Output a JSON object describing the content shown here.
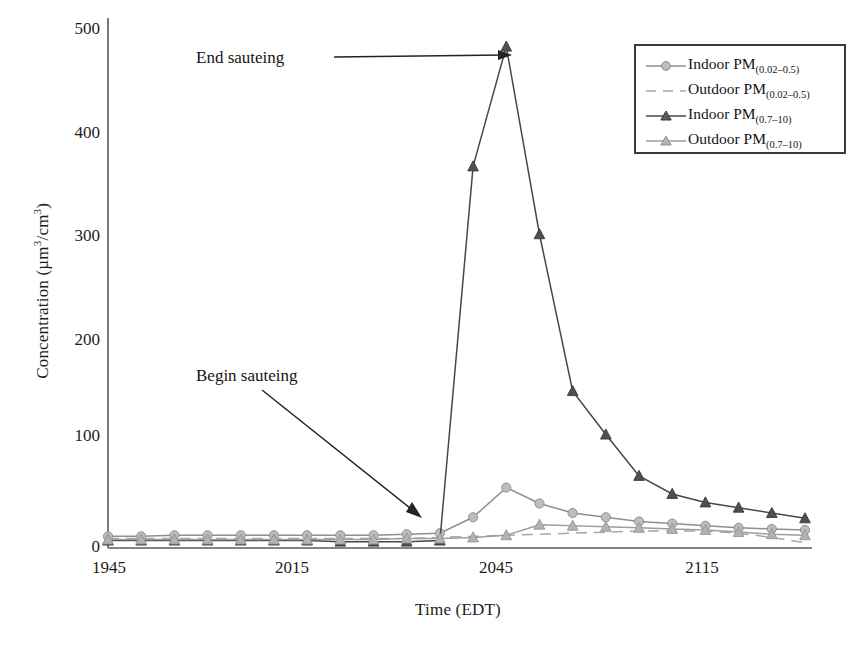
{
  "chart_data": {
    "type": "line",
    "title": "",
    "xlabel": "Time (EDT)",
    "ylabel": "Concentration (µm³/cm³)",
    "xlim": [
      1945,
      2135
    ],
    "ylim": [
      0,
      500
    ],
    "xticks": [
      "1945",
      "2015",
      "2045",
      "2115"
    ],
    "xtick_values": [
      1945,
      2015,
      2045,
      2115
    ],
    "yticks": [
      "0",
      "100",
      "200",
      "300",
      "400",
      "500"
    ],
    "ytick_values": [
      0,
      100,
      200,
      300,
      400,
      500
    ],
    "grid": false,
    "legend_position": "top-right",
    "x": [
      1945,
      1950,
      1955,
      2000,
      2005,
      2010,
      2015,
      2020,
      2025,
      2030,
      2035,
      2040,
      2045,
      2050,
      2055,
      2100,
      2105,
      2110,
      2115,
      2120,
      2125,
      2130
    ],
    "series": [
      {
        "name": "Indoor PM(0.02–0.5)",
        "marker": "circle",
        "linestyle": "solid",
        "color": "#8f8f8f",
        "values": [
          11,
          11,
          12,
          12,
          12,
          12,
          12,
          12,
          12,
          13,
          14,
          29,
          57,
          42,
          33,
          29,
          25,
          23,
          21,
          19,
          18,
          17
        ]
      },
      {
        "name": "Outdoor PM(0.02–0.5)",
        "marker": "none",
        "linestyle": "dashed",
        "color": "#a8a8a8",
        "values": [
          9,
          9,
          9,
          9,
          9,
          9,
          9,
          9,
          9,
          9,
          10,
          11,
          12,
          13,
          14,
          15,
          16,
          16,
          16,
          14,
          10,
          5
        ]
      },
      {
        "name": "Indoor PM(0.7–10)",
        "marker": "triangle",
        "linestyle": "solid",
        "color": "#474747",
        "values": [
          7,
          7,
          7,
          7,
          7,
          7,
          7,
          6,
          6,
          6,
          7,
          360,
          473,
          296,
          148,
          107,
          68,
          51,
          43,
          38,
          33,
          28
        ]
      },
      {
        "name": "Outdoor PM(0.7–10)",
        "marker": "triangle",
        "linestyle": "solid",
        "color": "#9e9e9e",
        "values": [
          8,
          8,
          8,
          8,
          8,
          8,
          8,
          8,
          8,
          9,
          9,
          10,
          12,
          22,
          21,
          20,
          19,
          18,
          17,
          15,
          13,
          12
        ]
      }
    ],
    "annotations": [
      {
        "text": "End sauteing",
        "target_x": 2045,
        "target_y": 473
      },
      {
        "text": "Begin sauteing",
        "target_x": 2032,
        "target_y": 30
      }
    ]
  },
  "legend": {
    "items": [
      {
        "label_main": "Indoor PM",
        "label_sub": "(0.02–0.5)",
        "key": "circle-solid"
      },
      {
        "label_main": "Outdoor PM",
        "label_sub": "(0.02–0.5)",
        "key": "dashed"
      },
      {
        "label_main": "Indoor PM",
        "label_sub": "(0.7–10)",
        "key": "triangle-dark-solid"
      },
      {
        "label_main": "Outdoor PM",
        "label_sub": "(0.7–10)",
        "key": "triangle-light-solid"
      }
    ]
  },
  "annotations": {
    "end_sauteing": "End sauteing",
    "begin_sauteing": "Begin sauteing"
  },
  "axes": {
    "x_title": "Time (EDT)",
    "y_title": "Concentration (µm³/cm³)",
    "y_unit_base": "Concentration (µm",
    "x_tick_0": "1945",
    "x_tick_1": "2015",
    "x_tick_2": "2045",
    "x_tick_3": "2115",
    "y_tick_0": "0",
    "y_tick_1": "100",
    "y_tick_2": "200",
    "y_tick_3": "300",
    "y_tick_4": "400",
    "y_tick_5": "500"
  },
  "colors": {
    "axis": "#4a4a4a",
    "indoor_fine": "#8f8f8f",
    "outdoor_fine": "#a8a8a8",
    "indoor_coarse": "#474747",
    "outdoor_coarse": "#9e9e9e",
    "legend_border": "#3a3a3a",
    "annotation": "#141414"
  }
}
